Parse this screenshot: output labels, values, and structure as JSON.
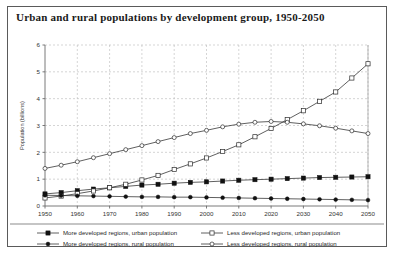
{
  "figure": {
    "title": "Urban and rural populations by development group, 1950-2050",
    "border_color": "#5a5a5a",
    "background": "#ffffff"
  },
  "chart_data": {
    "type": "line",
    "title": "Urban and rural populations by development group, 1950-2050",
    "xlabel": "",
    "ylabel": "Population (billions)",
    "xlim": [
      1950,
      2050
    ],
    "ylim": [
      0,
      6
    ],
    "xticks": [
      1950,
      1960,
      1970,
      1980,
      1990,
      2000,
      2010,
      2020,
      2030,
      2040,
      2050
    ],
    "yticks": [
      0,
      1,
      2,
      3,
      4,
      5,
      6
    ],
    "grid": true,
    "legend_position": "bottom",
    "x": [
      1950,
      1955,
      1960,
      1965,
      1970,
      1975,
      1980,
      1985,
      1990,
      1995,
      2000,
      2005,
      2010,
      2015,
      2020,
      2025,
      2030,
      2035,
      2040,
      2045,
      2050
    ],
    "series": [
      {
        "name": "More developed regions, urban population",
        "marker": "filled-square",
        "values": [
          0.45,
          0.5,
          0.57,
          0.63,
          0.68,
          0.73,
          0.78,
          0.81,
          0.85,
          0.88,
          0.9,
          0.93,
          0.96,
          0.98,
          1.0,
          1.02,
          1.04,
          1.06,
          1.07,
          1.08,
          1.09
        ]
      },
      {
        "name": "Less developed regions, urban population",
        "marker": "open-square",
        "values": [
          0.3,
          0.37,
          0.46,
          0.56,
          0.68,
          0.81,
          0.97,
          1.14,
          1.36,
          1.57,
          1.79,
          2.03,
          2.28,
          2.58,
          2.89,
          3.22,
          3.55,
          3.9,
          4.25,
          4.77,
          5.3
        ]
      },
      {
        "name": "More developed regions, rural population",
        "marker": "filled-circle",
        "values": [
          0.4,
          0.39,
          0.38,
          0.37,
          0.36,
          0.35,
          0.34,
          0.34,
          0.33,
          0.33,
          0.32,
          0.31,
          0.3,
          0.29,
          0.28,
          0.27,
          0.26,
          0.25,
          0.24,
          0.23,
          0.22
        ]
      },
      {
        "name": "Less developed regions, rural population",
        "marker": "open-circle",
        "values": [
          1.4,
          1.52,
          1.65,
          1.8,
          1.95,
          2.1,
          2.25,
          2.4,
          2.55,
          2.7,
          2.82,
          2.95,
          3.05,
          3.12,
          3.15,
          3.12,
          3.06,
          2.99,
          2.9,
          2.8,
          2.7
        ]
      }
    ]
  },
  "legend": {
    "items": [
      {
        "label": "More developed regions, urban population",
        "marker": "filled-square"
      },
      {
        "label": "Less developed regions, urban population",
        "marker": "open-square"
      },
      {
        "label": "More developed regions, rural population",
        "marker": "filled-circle"
      },
      {
        "label": "Less developed regions, rural population",
        "marker": "open-circle"
      }
    ]
  }
}
